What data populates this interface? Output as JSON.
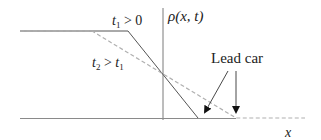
{
  "diagram": {
    "type": "traffic density profile",
    "labels": {
      "t1_var": "t",
      "t1_sub": "1",
      "t1_rel": " > 0",
      "t2_var": "t",
      "t2_sub": "2",
      "t2_rel": " > ",
      "t2_rhs_var": "t",
      "t2_rhs_sub": "1",
      "axis_y": "ρ(x, t)",
      "axis_x": "x",
      "lead_car": "Lead car"
    },
    "curves": [
      {
        "name": "t1 > 0",
        "style": "solid",
        "points": [
          [
            20,
            31
          ],
          [
            128,
            31
          ],
          [
            198,
            118
          ],
          [
            305,
            118
          ]
        ]
      },
      {
        "name": "t2 > t1",
        "style": "dashed",
        "points": [
          [
            20,
            31
          ],
          [
            92,
            31
          ],
          [
            236,
            118
          ],
          [
            305,
            118
          ]
        ]
      }
    ],
    "colors": {
      "solid_line": "#4a4a4a",
      "dashed_line": "#b0b0b0",
      "axis": "#7a7a7a",
      "text": "#222222"
    }
  }
}
